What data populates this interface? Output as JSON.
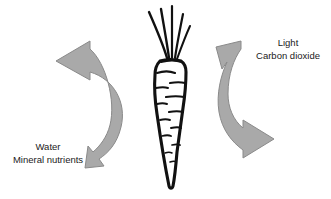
{
  "diagram": {
    "background_color": "#ffffff",
    "arrow_fill": "#a9a9a9",
    "arrow_stroke": "#8c8c8c",
    "plant_outline": "#111111",
    "plant_fill": "#ffffff",
    "text_color": "#1a1a1a"
  },
  "plant": {
    "name": "carrot",
    "leaf_count": 5
  },
  "labels": {
    "left": {
      "name": "below-ground-inputs",
      "line1": "Water",
      "line2": "Mineral nutrients"
    },
    "right": {
      "name": "above-ground-inputs",
      "line1": "Light",
      "line2": "Carbon dioxide"
    }
  },
  "arrows": {
    "left": {
      "name": "left-curved-arrow",
      "direction": "double-headed",
      "points_to": "Water / Mineral nutrients"
    },
    "right": {
      "name": "right-curved-arrow",
      "direction": "double-headed",
      "points_to": "Light / Carbon dioxide"
    }
  }
}
